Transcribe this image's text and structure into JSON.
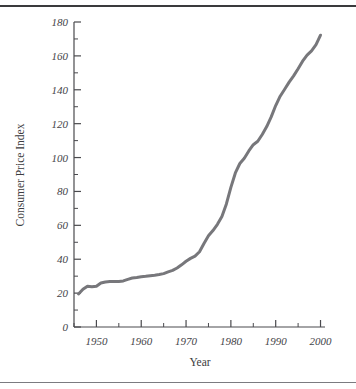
{
  "figure": {
    "background_color": "#ffffff",
    "rule_top_color": "#3a3a3c",
    "rule_bottom_color": "#7b7b80"
  },
  "chart_data": {
    "type": "line",
    "title": "",
    "subtitle": "",
    "xlabel": "Year",
    "ylabel": "Consumer Price Index",
    "xlim": [
      1945,
      2001
    ],
    "ylim": [
      0,
      180
    ],
    "grid": false,
    "legend": false,
    "legend_position": "none",
    "line_color": "#77777b",
    "line_width": 3,
    "x_major_ticks": [
      1950,
      1960,
      1970,
      1980,
      1990,
      2000
    ],
    "x_major_tick_labels": [
      "1950",
      "1960",
      "1970",
      "1980",
      "1990",
      "2000"
    ],
    "x_minor_ticks": [
      1945,
      1955,
      1965,
      1975,
      1985,
      1995
    ],
    "y_major_ticks": [
      0,
      20,
      40,
      60,
      80,
      100,
      120,
      140,
      160,
      180
    ],
    "y_major_tick_labels": [
      "0",
      "20",
      "40",
      "60",
      "80",
      "100",
      "120",
      "140",
      "160",
      "180"
    ],
    "y_minor_ticks": [
      10,
      30,
      50,
      70,
      90,
      110,
      130,
      150,
      170
    ],
    "series": [
      {
        "name": "Consumer Price Index",
        "x": [
          1946,
          1947,
          1948,
          1949,
          1950,
          1951,
          1952,
          1953,
          1954,
          1955,
          1956,
          1957,
          1958,
          1959,
          1960,
          1961,
          1962,
          1963,
          1964,
          1965,
          1966,
          1967,
          1968,
          1969,
          1970,
          1971,
          1972,
          1973,
          1974,
          1975,
          1976,
          1977,
          1978,
          1979,
          1980,
          1981,
          1982,
          1983,
          1984,
          1985,
          1986,
          1987,
          1988,
          1989,
          1990,
          1991,
          1992,
          1993,
          1994,
          1995,
          1996,
          1997,
          1998,
          1999,
          2000
        ],
        "values": [
          19.5,
          22.3,
          24.1,
          23.8,
          24.1,
          26.0,
          26.6,
          26.8,
          26.9,
          26.8,
          27.2,
          28.1,
          28.9,
          29.2,
          29.6,
          29.9,
          30.3,
          30.6,
          31.0,
          31.5,
          32.5,
          33.4,
          34.8,
          36.7,
          38.8,
          40.5,
          41.8,
          44.4,
          49.3,
          53.8,
          56.9,
          60.6,
          65.2,
          72.6,
          82.4,
          90.9,
          96.5,
          99.6,
          103.9,
          107.6,
          109.6,
          113.6,
          118.3,
          124.0,
          130.7,
          136.2,
          140.3,
          144.5,
          148.2,
          152.4,
          156.9,
          160.5,
          163.0,
          166.6,
          172.2
        ]
      }
    ]
  },
  "axis": {
    "y_label_text": "Consumer Price Index",
    "x_label_text": "Year"
  }
}
